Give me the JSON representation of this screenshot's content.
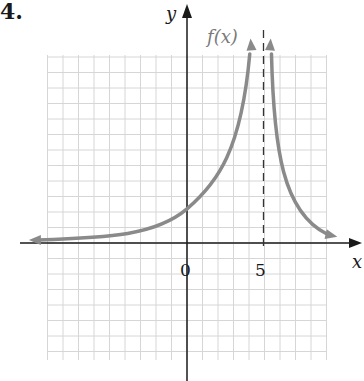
{
  "problem": {
    "number": "4."
  },
  "axes": {
    "x_label": "x",
    "y_label": "y",
    "tick_labels": [
      "0",
      "5"
    ]
  },
  "function_label": "f(x)",
  "colors": {
    "curve": "#8a8a8a",
    "axis": "#1a1a1a",
    "grid": "#d6d6d6",
    "asymptote": "#333333",
    "label": "#7a7a7a"
  },
  "chart_data": {
    "type": "line",
    "title": "",
    "xlabel": "x",
    "ylabel": "y",
    "xlim": [
      -9,
      9
    ],
    "ylim": [
      -8,
      12
    ],
    "grid": true,
    "legend": null,
    "annotations": [
      "f(x)",
      "vertical dashed asymptote at x = 5",
      "tick label 0 at origin",
      "tick label 5 on x-axis"
    ],
    "vertical_asymptote": 5,
    "horizontal_asymptote": 0,
    "series": [
      {
        "name": "f(x) left branch",
        "x": [
          -9,
          -7,
          -5,
          -3,
          -1,
          0,
          1,
          2,
          3,
          3.5,
          4,
          4.3
        ],
        "y": [
          0.2,
          0.3,
          0.4,
          0.6,
          1.2,
          2.0,
          3.0,
          4.3,
          6.5,
          8.5,
          11.5,
          13
        ]
      },
      {
        "name": "f(x) right branch",
        "x": [
          5.3,
          5.5,
          6,
          6.5,
          7,
          7.5,
          8,
          8.5,
          9.3
        ],
        "y": [
          13,
          10,
          6,
          4,
          2.8,
          1.8,
          1.2,
          0.8,
          0.5
        ]
      }
    ]
  }
}
